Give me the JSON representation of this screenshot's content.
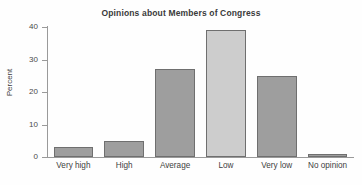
{
  "chart_data": {
    "type": "bar",
    "title": "Opinions about Members of Congress",
    "xlabel": "",
    "ylabel": "Percent",
    "categories": [
      "Very high",
      "High",
      "Average",
      "Low",
      "Very low",
      "No opinion"
    ],
    "values": [
      3,
      5,
      27,
      39,
      25,
      1
    ],
    "ylim": [
      0,
      40
    ],
    "yticks": [
      0,
      10,
      20,
      30,
      40
    ],
    "ytick_labels": [
      "0",
      "10",
      "20",
      "30",
      "40"
    ],
    "grid": false,
    "legend": null,
    "bar_colors": [
      "#9e9e9e",
      "#9e9e9e",
      "#9e9e9e",
      "#cdcdcd",
      "#9e9e9e",
      "#9e9e9e"
    ],
    "bar_edge_color": "#6f6f6f",
    "axis_color": "#9a9a9a",
    "title_color": "#3a3a3a",
    "background": "#fefefe"
  }
}
